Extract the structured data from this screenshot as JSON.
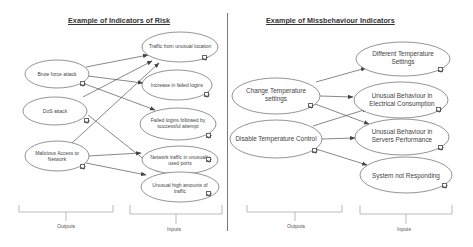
{
  "left_panel": {
    "title": "Example of Indicators of Risk",
    "outputs": [
      {
        "id": "brute",
        "label": "Brute force attack"
      },
      {
        "id": "dos",
        "label": "DoS attack"
      },
      {
        "id": "malicious",
        "label": "Malicious Access to Network"
      }
    ],
    "inputs": [
      {
        "id": "traffic_loc",
        "label": "Traffic from unusual location"
      },
      {
        "id": "failed_inc",
        "label": "Increase in failed logins"
      },
      {
        "id": "failed_succ",
        "label": "Failed logins followed by successful attempt"
      },
      {
        "id": "net_ports",
        "label": "Network traffic in unusually used ports"
      },
      {
        "id": "high_traffic",
        "label": "Unusual high amounts of traffic"
      }
    ],
    "edges": [
      [
        "brute",
        "traffic_loc"
      ],
      [
        "brute",
        "failed_inc"
      ],
      [
        "brute",
        "failed_succ"
      ],
      [
        "dos",
        "traffic_loc"
      ],
      [
        "dos",
        "high_traffic"
      ],
      [
        "malicious",
        "traffic_loc"
      ],
      [
        "malicious",
        "net_ports"
      ],
      [
        "malicious",
        "high_traffic"
      ]
    ],
    "outputs_label": "Outputs",
    "inputs_label": "Inputs"
  },
  "right_panel": {
    "title": "Example of Missbehaviour Indicators",
    "outputs": [
      {
        "id": "change_temp",
        "label": "Change Temperature settings"
      },
      {
        "id": "disable_temp",
        "label": "Disable Temperature Control"
      }
    ],
    "inputs": [
      {
        "id": "diff_temp",
        "label": "Different Temperature Settings"
      },
      {
        "id": "elec",
        "label": "Unusual Behaviour in Electrical Consumption"
      },
      {
        "id": "servers",
        "label": "Unusual Behaviour in Servers Performance"
      },
      {
        "id": "not_resp",
        "label": "System not Responding"
      }
    ],
    "edges": [
      [
        "change_temp",
        "diff_temp"
      ],
      [
        "change_temp",
        "elec"
      ],
      [
        "change_temp",
        "servers"
      ],
      [
        "disable_temp",
        "elec"
      ],
      [
        "disable_temp",
        "servers"
      ],
      [
        "disable_temp",
        "not_resp"
      ]
    ],
    "outputs_label": "Outputs",
    "inputs_label": "Inputs"
  },
  "colors": {
    "line": "#555555",
    "ellipse_stroke": "#666666",
    "divider": "#555555",
    "brace": "#aaaaaa"
  }
}
